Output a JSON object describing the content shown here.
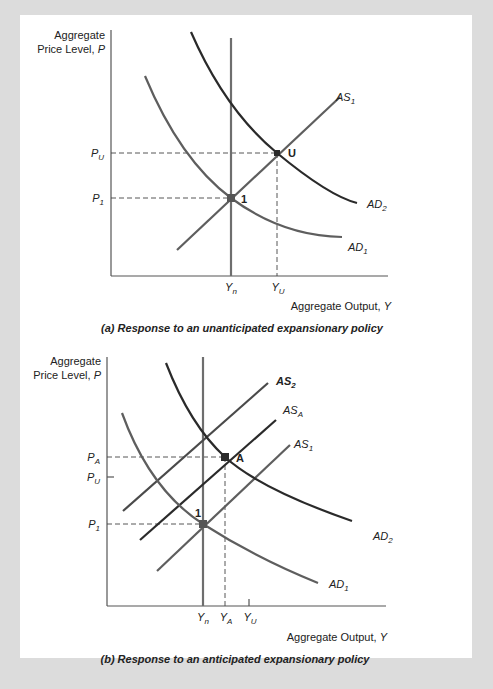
{
  "figure": {
    "panel_a": {
      "caption": "(a) Response to an unanticipated expansionary policy",
      "y_axis_title_line1": "Aggregate",
      "y_axis_title_line2": "Price Level, ",
      "y_axis_var": "P",
      "x_axis_title": "Aggregate Output, ",
      "x_axis_var": "Y",
      "price_labels": [
        {
          "base": "P",
          "sub": "U"
        },
        {
          "base": "P",
          "sub": "1"
        }
      ],
      "output_labels": [
        {
          "base": "Y",
          "sub": "n"
        },
        {
          "base": "Y",
          "sub": "U"
        }
      ],
      "curves": [
        {
          "base": "AS",
          "sub": "1"
        },
        {
          "base": "AD",
          "sub": "2"
        },
        {
          "base": "AD",
          "sub": "1"
        }
      ],
      "points": [
        "1",
        "U"
      ]
    },
    "panel_b": {
      "caption": "(b) Response to an anticipated expansionary policy",
      "y_axis_title_line1": "Aggregate",
      "y_axis_title_line2": "Price Level, ",
      "y_axis_var": "P",
      "x_axis_title": "Aggregate Output, ",
      "x_axis_var": "Y",
      "price_labels": [
        {
          "base": "P",
          "sub": "A"
        },
        {
          "base": "P",
          "sub": "U"
        },
        {
          "base": "P",
          "sub": "1"
        }
      ],
      "output_labels": [
        {
          "base": "Y",
          "sub": "n"
        },
        {
          "base": "Y",
          "sub": "A"
        },
        {
          "base": "Y",
          "sub": "U"
        }
      ],
      "curves": [
        {
          "base": "AS",
          "sub": "2"
        },
        {
          "base": "AS",
          "sub": "A"
        },
        {
          "base": "AS",
          "sub": "1"
        },
        {
          "base": "AD",
          "sub": "2"
        },
        {
          "base": "AD",
          "sub": "1"
        }
      ],
      "points": [
        "1",
        "A"
      ]
    }
  },
  "colors": {
    "background": "#dcdcdc",
    "panel": "#ffffff",
    "axis": "#555555",
    "curve_dark": "#2a2a2a",
    "curve_gray": "#5e5e5e",
    "lras": "#6e6e6e"
  }
}
